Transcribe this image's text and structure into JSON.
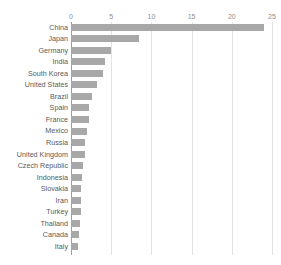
{
  "chart_data": {
    "type": "bar",
    "orientation": "horizontal",
    "title": "",
    "xlabel": "",
    "ylabel": "",
    "xlim": [
      0,
      25
    ],
    "xticks": [
      "0",
      "5",
      "10",
      "15",
      "20",
      "25"
    ],
    "xtick_values": [
      0,
      5,
      10,
      15,
      20,
      25
    ],
    "grid": true,
    "legend": false,
    "bar_color": "#a8a8a8",
    "gridline_color": "#e2e2e2",
    "axis_color": "#9d9d9d",
    "label_color": "#5a5a5a",
    "tick_color": "#8d8d8d",
    "categories": [
      "China",
      "Japan",
      "Germany",
      "India",
      "South Korea",
      "United States",
      "Brazil",
      "Spain",
      "France",
      "Mexico",
      "Russia",
      "United Kingdom",
      "Czech Republic",
      "Indonesia",
      "Slovakia",
      "Iran",
      "Turkey",
      "Thailand",
      "Canada",
      "Italy"
    ],
    "values": [
      24.0,
      8.5,
      5.0,
      4.2,
      4.0,
      3.2,
      2.6,
      2.3,
      2.2,
      2.0,
      1.8,
      1.7,
      1.5,
      1.4,
      1.3,
      1.2,
      1.2,
      1.1,
      1.0,
      0.9
    ]
  }
}
